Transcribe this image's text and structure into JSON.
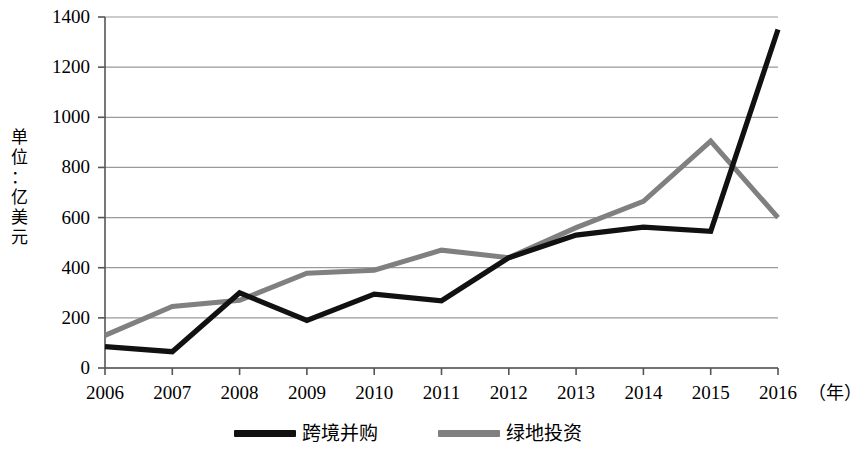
{
  "chart_data": {
    "type": "line",
    "title": "",
    "subtitle": "",
    "xlabel": "年",
    "ylabel": "单位：亿美元",
    "x": [
      2006,
      2007,
      2008,
      2009,
      2010,
      2011,
      2012,
      2013,
      2014,
      2015,
      2016
    ],
    "categories": [
      "2006",
      "2007",
      "2008",
      "2009",
      "2010",
      "2011",
      "2012",
      "2013",
      "2014",
      "2015",
      "2016"
    ],
    "series": [
      {
        "name": "跨境并购",
        "color": "#111111",
        "values": [
          85,
          65,
          300,
          190,
          295,
          268,
          440,
          530,
          562,
          545,
          1350
        ]
      },
      {
        "name": "绿地投资",
        "color": "#808080",
        "values": [
          130,
          245,
          270,
          378,
          390,
          470,
          440,
          560,
          665,
          905,
          600
        ]
      }
    ],
    "ylim": [
      0,
      1400
    ],
    "ytick_values": [
      0,
      200,
      400,
      600,
      800,
      1000,
      1200,
      1400
    ],
    "ytick_labels": [
      "0",
      "200",
      "400",
      "600",
      "800",
      "1000",
      "1200",
      "1400"
    ],
    "grid": "horizontal",
    "legend_position": "bottom"
  },
  "axis": {
    "y_title_chars": [
      "单",
      "位",
      "：",
      "亿",
      "美",
      "元"
    ],
    "x_unit_label": "（年）"
  },
  "colors": {
    "series_primary": "#111111",
    "series_secondary": "#808080",
    "grid": "#9a9a9a",
    "axis": "#555555",
    "background": "#ffffff"
  }
}
